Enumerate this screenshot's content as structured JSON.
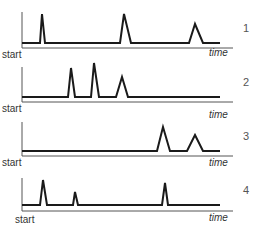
{
  "diagram": {
    "colors": {
      "trace": "#1a1a1a",
      "axis": "#555555",
      "text": "#333333"
    },
    "axis_labels": {
      "start": "start",
      "end": "time"
    },
    "panels": [
      {
        "id": "1",
        "label": "1",
        "description": "Three spikes: early narrow, middle tall, late smaller",
        "spikes": [
          {
            "x_frac": 0.1,
            "height": "high",
            "width": "narrow"
          },
          {
            "x_frac": 0.51,
            "height": "high",
            "width": "wide"
          },
          {
            "x_frac": 0.84,
            "height": "medium",
            "width": "wide"
          }
        ]
      },
      {
        "id": "2",
        "label": "2",
        "description": "Three spikes clustered in the first half",
        "spikes": [
          {
            "x_frac": 0.24,
            "height": "high",
            "width": "narrow"
          },
          {
            "x_frac": 0.35,
            "height": "highest",
            "width": "narrow"
          },
          {
            "x_frac": 0.49,
            "height": "medium",
            "width": "wide"
          }
        ]
      },
      {
        "id": "3",
        "label": "3",
        "description": "Two spikes late in time",
        "spikes": [
          {
            "x_frac": 0.71,
            "height": "high",
            "width": "wide"
          },
          {
            "x_frac": 0.86,
            "height": "medium",
            "width": "wide"
          }
        ]
      },
      {
        "id": "4",
        "label": "4",
        "description": "Three narrow spikes: early tall, early small, late tall",
        "spikes": [
          {
            "x_frac": 0.1,
            "height": "high",
            "width": "narrow"
          },
          {
            "x_frac": 0.26,
            "height": "small",
            "width": "narrow"
          },
          {
            "x_frac": 0.7,
            "height": "high",
            "width": "narrow"
          }
        ]
      }
    ]
  }
}
